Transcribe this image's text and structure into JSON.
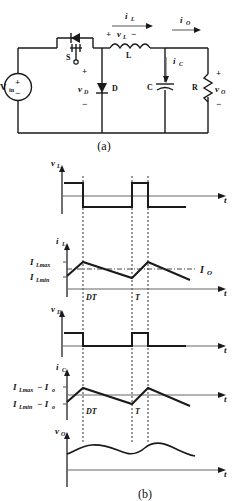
{
  "figure": {
    "panel_a_label": "(a)",
    "panel_b_label": "(b)",
    "title_hidden": ""
  },
  "circuit": {
    "source_label": "V",
    "source_sub": "in",
    "source_plus": "+",
    "source_minus": "−",
    "switch_label": "S",
    "diode_label": "D",
    "diode_voltage": "v",
    "diode_voltage_sub": "D",
    "diode_plus": "+",
    "diode_minus": "−",
    "inductor_label": "L",
    "inductor_voltage": "v",
    "inductor_voltage_sub": "L",
    "inductor_v_plus": "+",
    "inductor_v_minus": "−",
    "inductor_current": "i",
    "inductor_current_sub": "L",
    "output_current": "i",
    "output_current_sub": "O",
    "cap_label": "C",
    "cap_current": "i",
    "cap_current_sub": "C",
    "res_label": "R",
    "output_voltage": "v",
    "output_voltage_sub": "O",
    "out_plus": "+",
    "out_minus": "−"
  },
  "waveforms": {
    "time_axis_label": "t",
    "marker_dt": "DT",
    "marker_t": "T",
    "plots": [
      {
        "name": "inductor-voltage",
        "y_label": "v",
        "y_label_sub": "L",
        "type": "square-bipolar",
        "description": "v_L is positive (V_in - V_o) during 0..DT and negative (-V_o) during DT..T"
      },
      {
        "name": "inductor-current",
        "y_label": "i",
        "y_label_sub": "L",
        "type": "triangular-ripple",
        "level_labels": [
          {
            "text": "I",
            "sub": "Lmax"
          },
          {
            "text": "I",
            "sub": "Lmin"
          }
        ],
        "average_label": "I",
        "average_label_sub": "O",
        "description": "triangular inductor current ramping up to I_Lmax at DT then down to I_Lmin at T, average I_O"
      },
      {
        "name": "diode-voltage",
        "y_label": "v",
        "y_label_sub": "D",
        "type": "square-unipolar",
        "description": "v_D equals V_in during 0..DT and 0 during DT..T"
      },
      {
        "name": "capacitor-current",
        "y_label": "i",
        "y_label_sub": "C",
        "type": "triangular-ripple-shifted",
        "level_labels": [
          {
            "text": "I",
            "sub": "Lmax",
            "suffix": " − I",
            "suffix_sub": "o"
          },
          {
            "text": "I",
            "sub": "Lmin",
            "suffix": " − I",
            "suffix_sub": "o"
          }
        ],
        "description": "i_C = i_L - I_o, triangular waveform centred on zero"
      },
      {
        "name": "output-voltage",
        "y_label": "v",
        "y_label_sub": "O",
        "type": "smooth-ripple",
        "description": "v_O output voltage with smooth ripple about the average value"
      }
    ]
  },
  "colors": {
    "ink": "#1a1a1a",
    "axis": "#666666",
    "background": "#ffffff"
  }
}
